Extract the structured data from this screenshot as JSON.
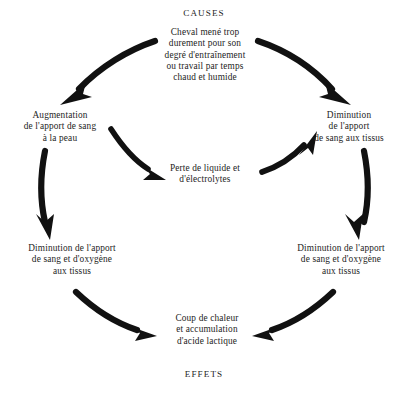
{
  "diagram": {
    "title_top": "CAUSES",
    "title_bottom": "EFFETS",
    "background_color": "#ffffff",
    "text_color": "#1d1d1d",
    "arrow_color": "#111111",
    "nodes": [
      {
        "id": "cause",
        "text": "Cheval mené trop durement pour son degré d'entraînement ou travail par temps chaud et humide",
        "lines": [
          "Cheval mené trop",
          "durement pour son",
          "degré d'entraînement",
          "ou travail par temps",
          "chaud et humide"
        ]
      },
      {
        "id": "skin-blood",
        "text": "Augmentation de l'apport de sang à la peau",
        "lines": [
          "Augmentation",
          "de l'apport de sang",
          "à la peau"
        ]
      },
      {
        "id": "tissue-blood",
        "text": "Diminution de l'apport de sang aux tissus",
        "lines": [
          "Diminution",
          "de l'apport",
          "de sang aux tissus"
        ]
      },
      {
        "id": "fluid-loss",
        "text": "Perte de liquide et d'électrolytes",
        "lines": [
          "Perte de liquide et",
          "d'électrolytes"
        ]
      },
      {
        "id": "left-oxygen",
        "text": "Diminution de l'apport de sang et d'oxygène aux tissus",
        "lines": [
          "Diminution de l'apport",
          "de sang et d'oxygène",
          "aux tissus"
        ]
      },
      {
        "id": "right-oxygen",
        "text": "Diminution de l'apport de sang et d'oxygène aux tissus",
        "lines": [
          "Diminution de l'apport",
          "de sang et d'oxygène",
          "aux tissus"
        ]
      },
      {
        "id": "heat-stroke",
        "text": "Coup de chaleur et accumulation d'acide lactique",
        "lines": [
          "Coup de chaleur",
          "et accumulation",
          "d'acide lactique"
        ]
      }
    ],
    "arrows": [
      {
        "id": "cause-to-skin-blood",
        "from": "cause",
        "to": "skin-blood"
      },
      {
        "id": "cause-to-tissue-blood",
        "from": "cause",
        "to": "tissue-blood"
      },
      {
        "id": "skin-blood-to-fluid-loss",
        "from": "skin-blood",
        "to": "fluid-loss"
      },
      {
        "id": "fluid-loss-to-tissue-blood",
        "from": "fluid-loss",
        "to": "tissue-blood"
      },
      {
        "id": "skin-blood-to-left-oxygen",
        "from": "skin-blood",
        "to": "left-oxygen"
      },
      {
        "id": "tissue-blood-to-right-oxygen",
        "from": "tissue-blood",
        "to": "right-oxygen"
      },
      {
        "id": "left-oxygen-to-heat-stroke",
        "from": "left-oxygen",
        "to": "heat-stroke"
      },
      {
        "id": "right-oxygen-to-heat-stroke",
        "from": "right-oxygen",
        "to": "heat-stroke"
      }
    ]
  }
}
